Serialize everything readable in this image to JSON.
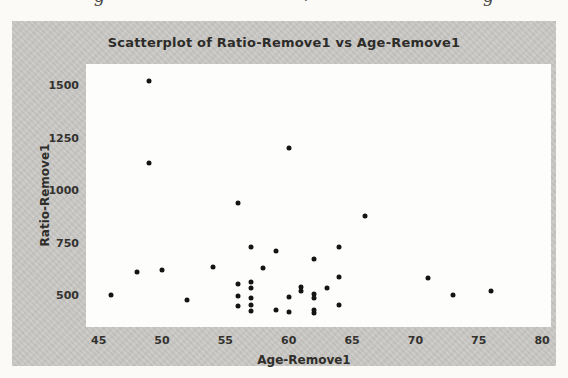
{
  "artifacts": {
    "fragments": [
      "g",
      "’",
      "g"
    ]
  },
  "chart_data": {
    "type": "scatter",
    "title": "Scatterplot of Ratio-Remove1 vs Age-Remove1",
    "xlabel": "Age-Remove1",
    "ylabel": "Ratio-Remove1",
    "xlim": [
      44,
      80.7
    ],
    "ylim": [
      348,
      1600
    ],
    "x_ticks": [
      45,
      50,
      55,
      60,
      65,
      70,
      75,
      80
    ],
    "y_ticks": [
      500,
      750,
      1000,
      1250,
      1500
    ],
    "grid": false,
    "legend": "none",
    "marker_color": "#141414",
    "figure_bg": "#c9c8c5",
    "plot_bg": "#fdfdfb",
    "points": [
      [
        46,
        500
      ],
      [
        48,
        610
      ],
      [
        49,
        1520
      ],
      [
        49,
        1130
      ],
      [
        50,
        620
      ],
      [
        52,
        475
      ],
      [
        54,
        635
      ],
      [
        56,
        940
      ],
      [
        56,
        555
      ],
      [
        56,
        495
      ],
      [
        56,
        450
      ],
      [
        57,
        730
      ],
      [
        57,
        560
      ],
      [
        57,
        535
      ],
      [
        57,
        488
      ],
      [
        57,
        452
      ],
      [
        57,
        425
      ],
      [
        58,
        630
      ],
      [
        59,
        710
      ],
      [
        59,
        430
      ],
      [
        60,
        1200
      ],
      [
        60,
        490
      ],
      [
        60,
        420
      ],
      [
        61,
        540
      ],
      [
        61,
        517
      ],
      [
        62,
        670
      ],
      [
        62,
        505
      ],
      [
        62,
        485
      ],
      [
        62,
        430
      ],
      [
        62,
        415
      ],
      [
        63,
        533
      ],
      [
        64,
        727
      ],
      [
        64,
        585
      ],
      [
        64,
        455
      ],
      [
        66,
        875
      ],
      [
        71,
        580
      ],
      [
        73,
        500
      ],
      [
        76,
        520
      ]
    ]
  }
}
